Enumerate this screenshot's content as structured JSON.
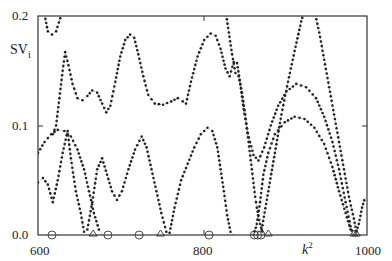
{
  "chart_data": {
    "type": "line",
    "title": "",
    "xlabel": "k²",
    "ylabel": "SVi",
    "xlim": [
      600,
      1000
    ],
    "ylim": [
      0.0,
      0.2
    ],
    "xticks": [
      "600",
      "800",
      "1000"
    ],
    "yticks": [
      "0.0",
      "0.1",
      "0.2"
    ],
    "grid": false,
    "legend": "none",
    "series": [
      {
        "name": "curve-top-left",
        "style": "dotted-with-dots",
        "points": [
          [
            607,
            0.205
          ],
          [
            612,
            0.186
          ],
          [
            617,
            0.183
          ],
          [
            622,
            0.186
          ],
          [
            627,
            0.198
          ],
          [
            629,
            0.205
          ]
        ]
      },
      {
        "name": "curve-upper",
        "style": "dotted-with-dots",
        "points": [
          [
            618,
            0.092
          ],
          [
            622,
            0.1
          ],
          [
            626,
            0.125
          ],
          [
            630,
            0.15
          ],
          [
            633,
            0.167
          ],
          [
            637,
            0.155
          ],
          [
            642,
            0.138
          ],
          [
            648,
            0.125
          ],
          [
            654,
            0.123
          ],
          [
            660,
            0.127
          ],
          [
            666,
            0.132
          ],
          [
            672,
            0.13
          ],
          [
            678,
            0.12
          ],
          [
            683,
            0.112
          ],
          [
            688,
            0.118
          ],
          [
            694,
            0.14
          ],
          [
            700,
            0.163
          ],
          [
            706,
            0.178
          ],
          [
            712,
            0.183
          ],
          [
            717,
            0.18
          ],
          [
            722,
            0.165
          ],
          [
            728,
            0.145
          ],
          [
            734,
            0.128
          ],
          [
            742,
            0.12
          ],
          [
            752,
            0.119
          ],
          [
            762,
            0.122
          ],
          [
            770,
            0.125
          ],
          [
            776,
            0.122
          ],
          [
            780,
            0.12
          ],
          [
            786,
            0.14
          ],
          [
            794,
            0.163
          ],
          [
            802,
            0.178
          ],
          [
            810,
            0.184
          ],
          [
            816,
            0.182
          ],
          [
            822,
            0.17
          ],
          [
            828,
            0.152
          ],
          [
            833,
            0.145
          ],
          [
            838,
            0.158
          ],
          [
            842,
            0.157
          ],
          [
            846,
            0.138
          ],
          [
            850,
            0.115
          ],
          [
            855,
            0.093
          ],
          [
            862,
            0.073
          ],
          [
            868,
            0.068
          ],
          [
            875,
            0.08
          ],
          [
            883,
            0.1
          ],
          [
            892,
            0.118
          ],
          [
            902,
            0.131
          ],
          [
            914,
            0.138
          ],
          [
            926,
            0.135
          ],
          [
            938,
            0.125
          ],
          [
            948,
            0.108
          ],
          [
            958,
            0.085
          ],
          [
            966,
            0.06
          ],
          [
            974,
            0.03
          ],
          [
            980,
            0.008
          ],
          [
            983,
            0.0
          ]
        ]
      },
      {
        "name": "curve-middle",
        "style": "dotted-with-dots",
        "points": [
          [
            600,
            0.075
          ],
          [
            608,
            0.085
          ],
          [
            616,
            0.092
          ],
          [
            624,
            0.096
          ],
          [
            632,
            0.095
          ],
          [
            640,
            0.09
          ],
          [
            648,
            0.078
          ],
          [
            656,
            0.06
          ],
          [
            662,
            0.04
          ],
          [
            668,
            0.02
          ],
          [
            674,
            0.005
          ],
          [
            678,
            0.0
          ]
        ]
      },
      {
        "name": "curve-lower",
        "style": "dotted-with-dots",
        "points": [
          [
            600,
            0.048
          ],
          [
            606,
            0.052
          ],
          [
            612,
            0.046
          ],
          [
            618,
            0.03
          ],
          [
            624,
            0.05
          ],
          [
            630,
            0.075
          ],
          [
            636,
            0.095
          ],
          [
            640,
            0.07
          ],
          [
            646,
            0.04
          ],
          [
            652,
            0.02
          ],
          [
            656,
            0.003
          ],
          [
            660,
            0.005
          ],
          [
            666,
            0.03
          ],
          [
            672,
            0.06
          ],
          [
            678,
            0.07
          ],
          [
            684,
            0.055
          ],
          [
            690,
            0.04
          ],
          [
            696,
            0.032
          ],
          [
            702,
            0.04
          ],
          [
            710,
            0.06
          ],
          [
            718,
            0.078
          ],
          [
            726,
            0.09
          ],
          [
            732,
            0.08
          ],
          [
            738,
            0.06
          ],
          [
            744,
            0.04
          ],
          [
            750,
            0.02
          ],
          [
            756,
            0.003
          ],
          [
            760,
            0.002
          ],
          [
            766,
            0.025
          ],
          [
            774,
            0.05
          ],
          [
            782,
            0.065
          ],
          [
            790,
            0.08
          ],
          [
            798,
            0.092
          ],
          [
            806,
            0.098
          ],
          [
            812,
            0.095
          ],
          [
            818,
            0.08
          ],
          [
            822,
            0.06
          ],
          [
            826,
            0.04
          ],
          [
            830,
            0.018
          ],
          [
            834,
            0.003
          ],
          [
            838,
            0.0
          ]
        ]
      },
      {
        "name": "curve-right-steep-a",
        "style": "dotted-with-dots",
        "points": [
          [
            828,
            0.205
          ],
          [
            832,
            0.185
          ],
          [
            836,
            0.165
          ],
          [
            840,
            0.148
          ],
          [
            844,
            0.145
          ],
          [
            848,
            0.13
          ],
          [
            852,
            0.11
          ],
          [
            856,
            0.085
          ],
          [
            860,
            0.06
          ],
          [
            864,
            0.035
          ],
          [
            866,
            0.025
          ],
          [
            870,
            0.01
          ],
          [
            874,
            0.0
          ]
        ]
      },
      {
        "name": "curve-right-steep-b",
        "style": "dotted-with-dots",
        "points": [
          [
            862,
            0.0
          ],
          [
            866,
            0.01
          ],
          [
            870,
            0.03
          ],
          [
            874,
            0.055
          ],
          [
            880,
            0.075
          ],
          [
            888,
            0.092
          ],
          [
            900,
            0.103
          ],
          [
            912,
            0.108
          ],
          [
            924,
            0.106
          ],
          [
            936,
            0.098
          ],
          [
            948,
            0.083
          ],
          [
            958,
            0.062
          ],
          [
            966,
            0.04
          ],
          [
            974,
            0.02
          ],
          [
            980,
            0.005
          ],
          [
            984,
            0.0
          ]
        ]
      },
      {
        "name": "curve-right-rise",
        "style": "dotted-with-dots",
        "points": [
          [
            872,
            0.005
          ],
          [
            880,
            0.04
          ],
          [
            888,
            0.075
          ],
          [
            896,
            0.11
          ],
          [
            904,
            0.14
          ],
          [
            912,
            0.168
          ],
          [
            920,
            0.195
          ],
          [
            924,
            0.205
          ]
        ]
      },
      {
        "name": "curve-right-fall",
        "style": "dotted-with-dots",
        "points": [
          [
            936,
            0.205
          ],
          [
            942,
            0.185
          ],
          [
            948,
            0.16
          ],
          [
            954,
            0.135
          ],
          [
            960,
            0.11
          ],
          [
            966,
            0.085
          ],
          [
            972,
            0.06
          ],
          [
            978,
            0.035
          ],
          [
            984,
            0.015
          ],
          [
            988,
            0.0
          ]
        ]
      },
      {
        "name": "curve-edge-right",
        "style": "dotted-with-dots",
        "points": [
          [
            986,
            0.0
          ],
          [
            990,
            0.01
          ],
          [
            994,
            0.025
          ],
          [
            998,
            0.035
          ]
        ]
      }
    ],
    "markers": {
      "circles": [
        617,
        685,
        723,
        808,
        863,
        867,
        871
      ],
      "triangles": [
        667,
        749,
        880,
        984,
        987
      ]
    }
  }
}
